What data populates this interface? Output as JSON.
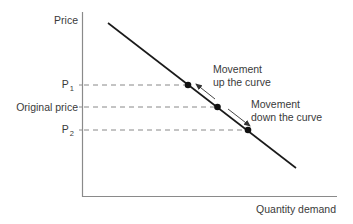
{
  "diagram": {
    "type": "demand-curve-movement",
    "y_axis_label": "Price",
    "x_axis_label": "Quantity demand",
    "price_levels": [
      {
        "id": "p1",
        "label": "P",
        "subscript": "1",
        "y": 85,
        "x_point": 188
      },
      {
        "id": "original",
        "label": "Original price",
        "subscript": "",
        "y": 107,
        "x_point": 218
      },
      {
        "id": "p2",
        "label": "P",
        "subscript": "2",
        "y": 130,
        "x_point": 248
      }
    ],
    "curve": {
      "x1": 108,
      "y1": 23,
      "x2": 296,
      "y2": 168,
      "color": "#1a1a1a"
    },
    "annotations": {
      "up": {
        "line1": "Movement",
        "line2": "up the curve"
      },
      "down": {
        "line1": "Movement",
        "line2": "down the curve"
      }
    },
    "colors": {
      "axis": "#8a8a8a",
      "dashed": "#7a7a7a",
      "curve": "#1a1a1a",
      "point": "#111111",
      "arrow": "#333333",
      "text": "#3a3a3a"
    }
  }
}
